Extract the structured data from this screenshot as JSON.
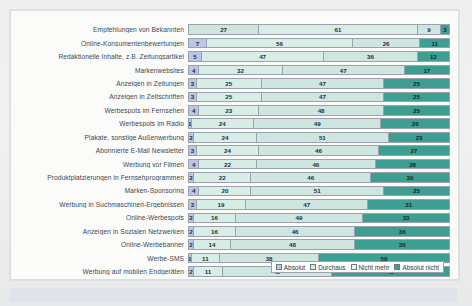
{
  "chart_data": {
    "type": "bar",
    "orientation": "horizontal",
    "stacked": true,
    "stack_total": 100,
    "title": "",
    "xlabel": "",
    "ylabel": "",
    "xlim": [
      0,
      100
    ],
    "grid": false,
    "legend_position": "bottom-right",
    "series": [
      {
        "name": "Absolut",
        "color": "#bcc4e8",
        "values": [
          27,
          7,
          5,
          4,
          3,
          3,
          4,
          1,
          2,
          3,
          4,
          2,
          4,
          3,
          2,
          2,
          2,
          1,
          2
        ]
      },
      {
        "name": "Durchaus",
        "color": "#aab3e0",
        "values": [
          61,
          56,
          47,
          32,
          25,
          25,
          23,
          24,
          24,
          24,
          22,
          22,
          20,
          19,
          16,
          16,
          14,
          11,
          11
        ]
      },
      {
        "name": "Nicht mehr",
        "color": "#dff0ea",
        "values": [
          9,
          26,
          36,
          47,
          47,
          47,
          48,
          49,
          51,
          46,
          46,
          46,
          51,
          47,
          49,
          46,
          48,
          38,
          42
        ]
      },
      {
        "name": "Absolut nicht",
        "color": "#3f9e92",
        "values": [
          3,
          11,
          12,
          17,
          25,
          25,
          25,
          26,
          23,
          27,
          28,
          30,
          25,
          31,
          33,
          36,
          36,
          50,
          45
        ]
      }
    ],
    "categories": [
      "Empfehlungen von Bekannten",
      "Online-Konsumentenbewertungen",
      "Redaktionelle Inhalte, z.B. Zeitungsartikel",
      "Markenwebsites",
      "Anzeigen in Zeitungen",
      "Anzeigen in Zeitschriften",
      "Werbespots im Fernsehen",
      "Werbespots im Radio",
      "Plakate, sonstige Außenwerbung",
      "Abonnierte E-Mail Newsletter",
      "Werbung vor Filmen",
      "Produktplatzierungen in Fernsehprogrammen",
      "Marken-Sponsoring",
      "Werbung in Suchmaschinen-Ergebnissen",
      "Online-Werbespots",
      "Anzeigen in Sozialen Netzwerken",
      "Online-Werbebanner",
      "Werbe-SMS",
      "Werbung auf mobilen Endgeräten"
    ]
  },
  "legend": {
    "items": [
      {
        "label": "Absolut"
      },
      {
        "label": "Durchaus"
      },
      {
        "label": "Nicht mehr"
      },
      {
        "label": "Absolut nicht"
      }
    ]
  }
}
